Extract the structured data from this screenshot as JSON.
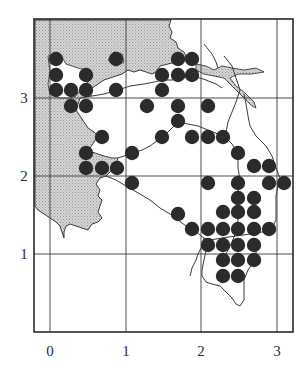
{
  "map": {
    "type": "dot-distribution-map",
    "colors": {
      "land_fill": "#c9c9c9",
      "line": "#3a3a3a",
      "dot": "#2b2b2b",
      "background": "#ffffff"
    },
    "frame": {
      "left": 34,
      "top": 19,
      "right": 293,
      "bottom": 332
    },
    "x_axis": {
      "ticks": [
        {
          "label": "0",
          "value": 0,
          "px": 50
        },
        {
          "label": "1",
          "value": 1,
          "px": 126
        },
        {
          "label": "2",
          "value": 2,
          "px": 201
        },
        {
          "label": "3",
          "value": 3,
          "px": 277
        }
      ]
    },
    "y_axis": {
      "ticks": [
        {
          "label": "1",
          "value": 1,
          "px": 254
        },
        {
          "label": "2",
          "value": 2,
          "px": 176
        },
        {
          "label": "3",
          "value": 3,
          "px": 98
        }
      ]
    },
    "dot_radius": 7.2,
    "dots": [
      [
        56,
        59
      ],
      [
        116,
        59
      ],
      [
        178,
        59
      ],
      [
        192,
        59
      ],
      [
        56,
        75
      ],
      [
        86,
        75
      ],
      [
        162,
        75
      ],
      [
        178,
        75
      ],
      [
        192,
        75
      ],
      [
        56,
        90
      ],
      [
        71,
        90
      ],
      [
        86,
        90
      ],
      [
        116,
        90
      ],
      [
        162,
        90
      ],
      [
        71,
        106
      ],
      [
        86,
        106
      ],
      [
        147,
        106
      ],
      [
        178,
        106
      ],
      [
        208,
        106
      ],
      [
        178,
        121
      ],
      [
        102,
        137
      ],
      [
        162,
        137
      ],
      [
        192,
        137
      ],
      [
        208,
        137
      ],
      [
        223,
        137
      ],
      [
        86,
        153
      ],
      [
        132,
        153
      ],
      [
        238,
        153
      ],
      [
        86,
        168
      ],
      [
        102,
        168
      ],
      [
        117,
        168
      ],
      [
        254,
        166
      ],
      [
        269,
        166
      ],
      [
        132,
        183
      ],
      [
        208,
        183
      ],
      [
        238,
        183
      ],
      [
        269,
        183
      ],
      [
        284,
        183
      ],
      [
        238,
        198
      ],
      [
        254,
        198
      ],
      [
        178,
        214
      ],
      [
        223,
        212
      ],
      [
        238,
        212
      ],
      [
        254,
        212
      ],
      [
        192,
        229
      ],
      [
        208,
        229
      ],
      [
        223,
        229
      ],
      [
        238,
        229
      ],
      [
        254,
        229
      ],
      [
        269,
        229
      ],
      [
        208,
        245
      ],
      [
        223,
        245
      ],
      [
        238,
        245
      ],
      [
        254,
        245
      ],
      [
        223,
        260
      ],
      [
        238,
        260
      ],
      [
        254,
        260
      ],
      [
        223,
        276
      ],
      [
        238,
        276
      ]
    ]
  },
  "chart_data": {
    "type": "scatter",
    "title": "",
    "xlabel": "",
    "ylabel": "",
    "x_ticks": [
      "0",
      "1",
      "2",
      "3"
    ],
    "y_ticks": [
      "1",
      "2",
      "3"
    ],
    "xlim": [
      -0.2,
      3.2
    ],
    "ylim": [
      -0.95,
      3.05
    ],
    "grid": true,
    "series": [
      {
        "name": "occurrence records",
        "points": [
          [
            0.08,
            3.5
          ],
          [
            0.87,
            3.5
          ],
          [
            1.68,
            3.5
          ],
          [
            1.87,
            3.5
          ],
          [
            0.08,
            3.3
          ],
          [
            0.47,
            3.3
          ],
          [
            1.47,
            3.3
          ],
          [
            1.68,
            3.3
          ],
          [
            1.87,
            3.3
          ],
          [
            0.08,
            3.1
          ],
          [
            0.28,
            3.1
          ],
          [
            0.47,
            3.1
          ],
          [
            0.87,
            3.1
          ],
          [
            1.47,
            3.1
          ],
          [
            0.28,
            2.9
          ],
          [
            0.47,
            2.9
          ],
          [
            1.28,
            2.9
          ],
          [
            1.68,
            2.9
          ],
          [
            2.08,
            2.9
          ],
          [
            1.68,
            2.71
          ],
          [
            0.68,
            2.5
          ],
          [
            1.47,
            2.5
          ],
          [
            1.87,
            2.5
          ],
          [
            2.08,
            2.5
          ],
          [
            2.28,
            2.5
          ],
          [
            0.47,
            2.3
          ],
          [
            1.08,
            2.3
          ],
          [
            2.47,
            2.3
          ],
          [
            0.47,
            2.1
          ],
          [
            0.68,
            2.1
          ],
          [
            0.88,
            2.1
          ],
          [
            2.68,
            2.13
          ],
          [
            2.87,
            2.13
          ],
          [
            1.08,
            1.91
          ],
          [
            2.08,
            1.91
          ],
          [
            2.47,
            1.91
          ],
          [
            2.87,
            1.91
          ],
          [
            3.08,
            1.91
          ],
          [
            2.47,
            1.72
          ],
          [
            2.68,
            1.72
          ],
          [
            1.68,
            1.51
          ],
          [
            2.28,
            1.54
          ],
          [
            2.47,
            1.54
          ],
          [
            2.68,
            1.54
          ],
          [
            1.87,
            1.32
          ],
          [
            2.08,
            1.32
          ],
          [
            2.28,
            1.32
          ],
          [
            2.47,
            1.32
          ],
          [
            2.68,
            1.32
          ],
          [
            2.87,
            1.32
          ],
          [
            2.08,
            1.12
          ],
          [
            2.28,
            1.12
          ],
          [
            2.47,
            1.12
          ],
          [
            2.68,
            1.12
          ],
          [
            2.28,
            0.92
          ],
          [
            2.47,
            0.92
          ],
          [
            2.68,
            0.92
          ],
          [
            2.28,
            0.72
          ],
          [
            2.47,
            0.72
          ]
        ]
      }
    ]
  }
}
